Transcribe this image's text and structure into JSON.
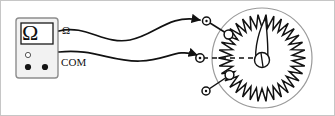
{
  "figure": {
    "background_color": "#ffffff",
    "line_color": "#1a1a1a",
    "border_color": "#b9b9b9",
    "width": 335,
    "height": 116
  },
  "meter": {
    "name": "ohmmeter",
    "body_fill": "#f2f2f2",
    "body_stroke": "#8d8d8d",
    "display": {
      "reading": "Ω",
      "fill": "#ffffff",
      "stroke": "#1a1a1a"
    },
    "jacks": [
      {
        "name": "jack-upper",
        "style": "hollow",
        "label": ""
      },
      {
        "name": "jack-omega",
        "style": "filled",
        "label": "Ω"
      },
      {
        "name": "jack-com",
        "style": "filled",
        "label": "COM"
      }
    ],
    "terminal_labels": {
      "omega": "Ω",
      "com": "COM"
    }
  },
  "leads": [
    {
      "name": "lead-omega",
      "from": "omega-jack",
      "to": "pot-terminal-top",
      "arrow": true
    },
    {
      "name": "lead-com",
      "from": "com-jack",
      "to": "pot-terminal-middle",
      "arrow": true
    }
  ],
  "potentiometer": {
    "name": "rotary-potentiometer",
    "outline_stroke": "#9a9a9a",
    "winding": {
      "name": "resistive-winding",
      "style": "zigzag",
      "teeth": 34,
      "stroke": "#111111"
    },
    "wiper": {
      "name": "wiper-arm",
      "shape": "teardrop",
      "angle_deg": -75
    },
    "hub": {
      "name": "center-hub",
      "style": "circle-with-slot"
    },
    "terminals": [
      {
        "name": "pot-terminal-top",
        "position": "upper-left"
      },
      {
        "name": "pot-terminal-middle",
        "position": "left"
      },
      {
        "name": "pot-terminal-bottom",
        "position": "lower-left"
      }
    ],
    "axis_line": {
      "name": "wiper-axis",
      "style": "dashed"
    }
  }
}
